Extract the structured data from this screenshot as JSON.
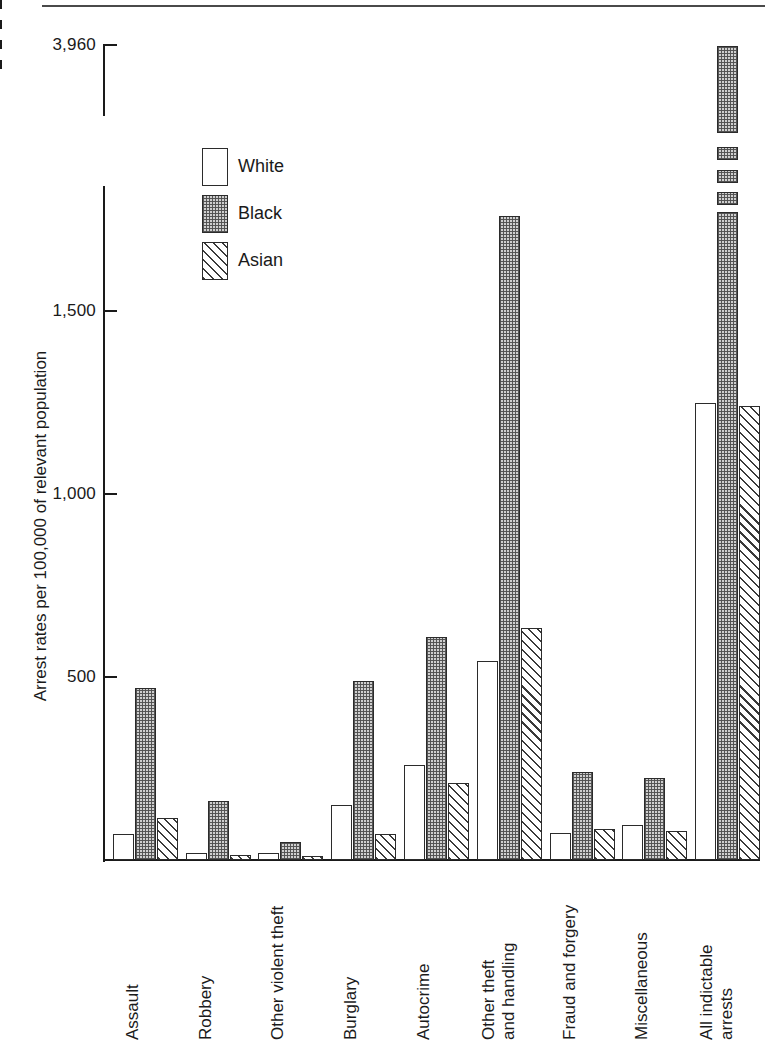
{
  "chart_data": {
    "type": "bar",
    "title": "",
    "xlabel": "",
    "ylabel": "Arrest rates per 100,000 of relevant population",
    "categories": [
      "Assault",
      "Robbery",
      "Other violent theft",
      "Burglary",
      "Autocrime",
      "Other theft and handling",
      "Fraud and forgery",
      "Miscellaneous",
      "All indictable arrests"
    ],
    "category_lines": [
      [
        "Assault"
      ],
      [
        "Robbery"
      ],
      [
        "Other violent theft"
      ],
      [
        "Burglary"
      ],
      [
        "Autocrime"
      ],
      [
        "Other theft",
        "and handling"
      ],
      [
        "Fraud and forgery"
      ],
      [
        "Miscellaneous"
      ],
      [
        "All indictable",
        "arrests"
      ]
    ],
    "series": [
      {
        "name": "White",
        "fill": "empty",
        "values": [
          70,
          20,
          18,
          150,
          260,
          545,
          75,
          95,
          1250
        ]
      },
      {
        "name": "Black",
        "fill": "stippled",
        "values": [
          470,
          160,
          50,
          490,
          610,
          1960,
          240,
          225,
          3960
        ]
      },
      {
        "name": "Asian",
        "fill": "hatched",
        "values": [
          115,
          15,
          10,
          70,
          210,
          635,
          85,
          80,
          1240
        ]
      }
    ],
    "ylim": [
      0,
      3960
    ],
    "yticks": [
      500,
      1000,
      1500,
      3960
    ],
    "ytick_labels": [
      "500",
      "1,000",
      "1,500",
      "3,960"
    ],
    "axis_break": {
      "present": true,
      "style": "dashed",
      "between": [
        1700,
        3800
      ]
    },
    "grid": false,
    "legend": {
      "position": "upper-left-inside",
      "entries": [
        {
          "label": "White",
          "fill": "empty"
        },
        {
          "label": "Black",
          "fill": "stippled"
        },
        {
          "label": "Asian",
          "fill": "hatched"
        }
      ]
    },
    "colors": {
      "line": "#2b2b2b",
      "text": "#1a1a1a",
      "background": "#ffffff",
      "stipple": "#cfcfcf",
      "hatch": "#3a3a3a"
    }
  }
}
